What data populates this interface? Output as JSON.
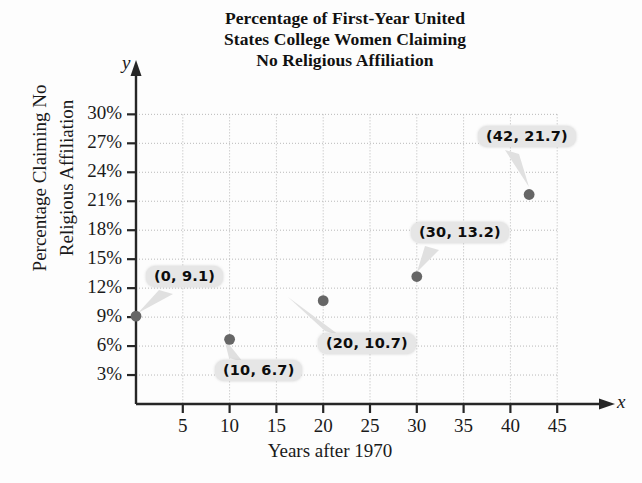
{
  "chart_data": {
    "type": "scatter",
    "title": "Percentage of First-Year United States College Women Claiming No Religious Affiliation",
    "title_lines": [
      "Percentage of First-Year United",
      "States College Women Claiming",
      "No Religious Affiliation"
    ],
    "xlabel": "Years after 1970",
    "ylabel": "Percentage Claiming No Religious Affiliation",
    "ylabel_lines": [
      "Percentage Claiming No",
      "Religious Affiliation"
    ],
    "axis_letter_x": "x",
    "axis_letter_y": "y",
    "x": [
      0,
      10,
      20,
      30,
      42
    ],
    "values": [
      9.1,
      6.7,
      10.7,
      13.2,
      21.7
    ],
    "point_labels": [
      "(0, 9.1)",
      "(10, 6.7)",
      "(20, 10.7)",
      "(30, 13.2)",
      "(42, 21.7)"
    ],
    "xlim": [
      0,
      48
    ],
    "ylim": [
      0,
      31
    ],
    "xticks": [
      5,
      10,
      15,
      20,
      25,
      30,
      35,
      40,
      45
    ],
    "xtick_labels": [
      "5",
      "10",
      "15",
      "20",
      "25",
      "30",
      "35",
      "40",
      "45"
    ],
    "yticks": [
      3,
      6,
      9,
      12,
      15,
      18,
      21,
      24,
      27,
      30
    ],
    "ytick_labels": [
      "3%",
      "6%",
      "9%",
      "12%",
      "15%",
      "18%",
      "21%",
      "24%",
      "27%",
      "30%"
    ],
    "grid": true,
    "grid_style": "dotted",
    "legend": "none",
    "colors": {
      "marker": "#666666",
      "axis": "#262626",
      "grid": "#b9b9b9",
      "callout_bg": "#e6e6e6",
      "callout_text": "#0d0d0d",
      "background": "#fdfdfd"
    }
  }
}
